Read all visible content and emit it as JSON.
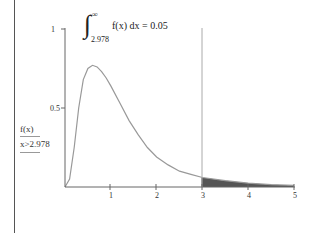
{
  "chart_data": {
    "type": "area",
    "title": "",
    "annotation": {
      "integral_lower": "2.978",
      "integral_upper": "∞",
      "integrand": "f(x) dx = 0.05"
    },
    "xlabel": "",
    "ylabel_top": "f(x)",
    "ylabel_bottom": "x>2.978",
    "xlim": [
      0,
      5
    ],
    "ylim": [
      0,
      1
    ],
    "x_ticks": [
      "1",
      "2",
      "3",
      "4",
      "5"
    ],
    "y_ticks": [
      "0.5",
      "1"
    ],
    "grid": false,
    "marker_line_x": 3,
    "shaded_region": {
      "from": 2.978,
      "to": 5,
      "color": "#555555"
    },
    "series": [
      {
        "name": "f(x)",
        "color": "#999999",
        "x": [
          0,
          0.1,
          0.2,
          0.3,
          0.4,
          0.5,
          0.6,
          0.7,
          0.8,
          0.9,
          1.0,
          1.2,
          1.4,
          1.6,
          1.8,
          2.0,
          2.25,
          2.5,
          2.75,
          3.0,
          3.5,
          4.0,
          4.5,
          5.0
        ],
        "y": [
          0,
          0.05,
          0.25,
          0.5,
          0.68,
          0.75,
          0.77,
          0.76,
          0.73,
          0.69,
          0.64,
          0.53,
          0.42,
          0.33,
          0.25,
          0.19,
          0.14,
          0.1,
          0.08,
          0.06,
          0.04,
          0.025,
          0.015,
          0.01
        ]
      }
    ]
  },
  "labels": {
    "y_axis_num": "f(x)",
    "y_axis_den": "x>2.978",
    "tick_half": "0.5",
    "tick_one": "1",
    "xt1": "1",
    "xt2": "2",
    "xt3": "3",
    "xt4": "4",
    "xt5": "5",
    "int_upper": "∞",
    "int_lower": "2.978",
    "int_body": "f(x) dx = 0.05"
  }
}
